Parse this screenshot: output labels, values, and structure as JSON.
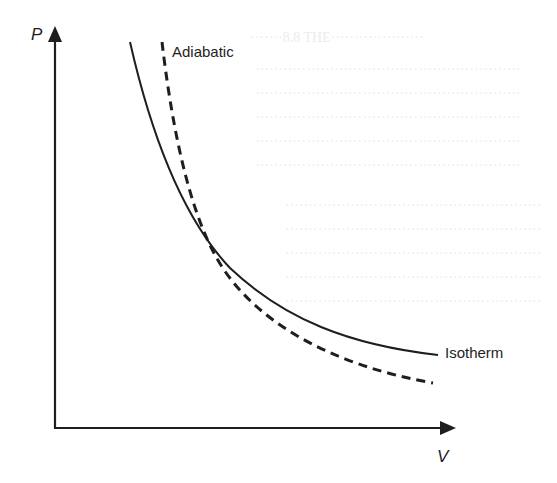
{
  "diagram": {
    "type": "P-V diagram",
    "axes": {
      "y_label": "P",
      "x_label": "V"
    },
    "curves": [
      {
        "name": "Isotherm",
        "label": "Isotherm",
        "style": "solid"
      },
      {
        "name": "Adiabatic",
        "label": "Adiabatic",
        "style": "dashed"
      }
    ],
    "colors": {
      "ink": "#1e1e1e",
      "background": "#ffffff"
    }
  }
}
